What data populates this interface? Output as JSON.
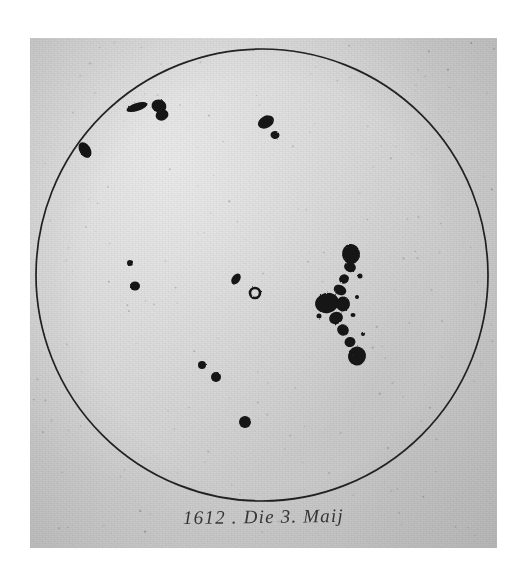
{
  "document": {
    "type": "historical-astronomical-drawing",
    "subject": "solar-disc-with-sunspots",
    "caption": "1612 . Die 3. Maij",
    "paper_color": "#d2d2d2",
    "ink_color": "#141414",
    "page_background": "#ffffff"
  },
  "chart_data": {
    "type": "scatter",
    "title": "1612 . Die 3. Maij",
    "xlabel": "",
    "ylabel": "",
    "grid": false,
    "legend": "none",
    "disc": {
      "label": "solar-disc",
      "cx": 232,
      "cy": 237,
      "r": 226,
      "stroke": "#141414",
      "stroke_width": 1.6
    },
    "xlim": [
      0,
      467
    ],
    "ylim": [
      0,
      510
    ],
    "series": [
      {
        "name": "sunspots",
        "points": [
          {
            "id": "spot-limb-west",
            "x": 55,
            "y": 112,
            "rx": 5.5,
            "ry": 8.5,
            "rot": -32,
            "kind": "elongated"
          },
          {
            "id": "spot-streak-upper",
            "x": 107,
            "y": 69,
            "rx": 11,
            "ry": 4,
            "rot": -18,
            "kind": "streak"
          },
          {
            "id": "spot-cluster-upper-a",
            "x": 129,
            "y": 68,
            "rx": 7.5,
            "ry": 6.5,
            "rot": 15,
            "kind": "blob"
          },
          {
            "id": "spot-cluster-upper-b",
            "x": 132,
            "y": 77,
            "rx": 6.5,
            "ry": 5.5,
            "rot": -20,
            "kind": "blob"
          },
          {
            "id": "spot-upper-east-large",
            "x": 236,
            "y": 84,
            "rx": 8.5,
            "ry": 6,
            "rot": -28,
            "kind": "oval"
          },
          {
            "id": "spot-upper-east-small",
            "x": 245,
            "y": 97,
            "rx": 4.5,
            "ry": 4,
            "rot": 10,
            "kind": "blob"
          },
          {
            "id": "spot-center-tiny",
            "x": 100,
            "y": 225,
            "rx": 3,
            "ry": 3,
            "rot": 0,
            "kind": "dot"
          },
          {
            "id": "spot-center-left",
            "x": 105,
            "y": 248,
            "rx": 5,
            "ry": 4.5,
            "rot": 0,
            "kind": "blob"
          },
          {
            "id": "spot-center-mid",
            "x": 206,
            "y": 241,
            "rx": 6,
            "ry": 4,
            "rot": -55,
            "kind": "oval"
          },
          {
            "id": "spot-center-ring",
            "x": 225,
            "y": 255,
            "rx": 5,
            "ry": 5,
            "rot": 0,
            "kind": "ring"
          },
          {
            "id": "spot-lower-left",
            "x": 172,
            "y": 327,
            "rx": 4,
            "ry": 4,
            "rot": 0,
            "kind": "dot"
          },
          {
            "id": "spot-lower-mid",
            "x": 186,
            "y": 339,
            "rx": 5,
            "ry": 5,
            "rot": 0,
            "kind": "dot"
          },
          {
            "id": "spot-lower-bottom",
            "x": 215,
            "y": 384,
            "rx": 6,
            "ry": 6,
            "rot": 0,
            "kind": "dot"
          }
        ]
      },
      {
        "name": "great-sunspot-complex",
        "description": "large clustered chain of spots right of centre",
        "points": [
          {
            "id": "complex-top",
            "x": 321,
            "y": 216,
            "rx": 9,
            "ry": 10,
            "rot": -8,
            "kind": "blob"
          },
          {
            "id": "complex-top-tail",
            "x": 320,
            "y": 229,
            "rx": 6,
            "ry": 5,
            "rot": 20,
            "kind": "blob"
          },
          {
            "id": "complex-node-1",
            "x": 314,
            "y": 241,
            "rx": 5,
            "ry": 4.5,
            "rot": -30,
            "kind": "blob"
          },
          {
            "id": "complex-node-2",
            "x": 310,
            "y": 252,
            "rx": 6.5,
            "ry": 5,
            "rot": 25,
            "kind": "blob"
          },
          {
            "id": "complex-main-left",
            "x": 297,
            "y": 265,
            "rx": 12,
            "ry": 10,
            "rot": -15,
            "kind": "mass"
          },
          {
            "id": "complex-main-right",
            "x": 313,
            "y": 266,
            "rx": 7,
            "ry": 7.5,
            "rot": 10,
            "kind": "blob"
          },
          {
            "id": "complex-node-3",
            "x": 306,
            "y": 280,
            "rx": 7,
            "ry": 6,
            "rot": -20,
            "kind": "blob"
          },
          {
            "id": "complex-node-4",
            "x": 313,
            "y": 292,
            "rx": 6,
            "ry": 5.5,
            "rot": 35,
            "kind": "blob"
          },
          {
            "id": "complex-node-5",
            "x": 320,
            "y": 304,
            "rx": 5.5,
            "ry": 5,
            "rot": -10,
            "kind": "blob"
          },
          {
            "id": "complex-bottom",
            "x": 327,
            "y": 318,
            "rx": 9,
            "ry": 9.5,
            "rot": 12,
            "kind": "blob"
          },
          {
            "id": "complex-speck-a",
            "x": 330,
            "y": 238,
            "rx": 2.5,
            "ry": 2.5,
            "rot": 0,
            "kind": "dot"
          },
          {
            "id": "complex-speck-b",
            "x": 327,
            "y": 259,
            "rx": 2,
            "ry": 2,
            "rot": 0,
            "kind": "dot"
          },
          {
            "id": "complex-speck-c",
            "x": 323,
            "y": 277,
            "rx": 2.5,
            "ry": 2,
            "rot": 0,
            "kind": "dot"
          },
          {
            "id": "complex-speck-d",
            "x": 333,
            "y": 296,
            "rx": 2,
            "ry": 2,
            "rot": 0,
            "kind": "dot"
          },
          {
            "id": "complex-speck-e",
            "x": 289,
            "y": 278,
            "rx": 2.5,
            "ry": 2.5,
            "rot": 0,
            "kind": "dot"
          }
        ]
      }
    ]
  }
}
